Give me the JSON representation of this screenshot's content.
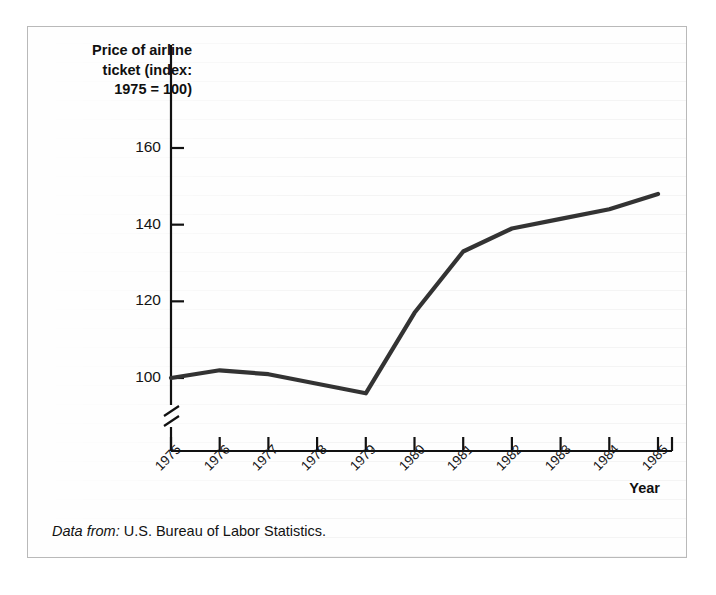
{
  "figure": {
    "y_axis_title": "Price of airline\nticket (index:\n1975 = 100)",
    "x_axis_title": "Year",
    "source_lead": "Data from:",
    "source_text": " U.S. Bureau of Labor Statistics.",
    "line_color": "#333333",
    "axis_color": "#111111",
    "frame_color": "#b9b9b9"
  },
  "chart_data": {
    "type": "line",
    "title": "",
    "xlabel": "Year",
    "ylabel": "Price of airline ticket (index: 1975 = 100)",
    "categories": [
      "1975",
      "1976",
      "1977",
      "1978",
      "1979",
      "1980",
      "1981",
      "1982",
      "1983",
      "1984",
      "1985"
    ],
    "x": [
      1975,
      1976,
      1977,
      1978,
      1979,
      1980,
      1981,
      1982,
      1983,
      1984,
      1985
    ],
    "values": [
      100,
      102,
      101,
      98.5,
      96,
      117,
      133,
      139,
      141.5,
      144,
      148
    ],
    "ylim": [
      90,
      168
    ],
    "yticks": [
      100,
      120,
      140,
      160
    ],
    "ytick_labels": [
      "100",
      "120",
      "140",
      "160"
    ],
    "grid": false,
    "legend": null,
    "axis_break": {
      "axis": "y",
      "note": "zigzag break on vertical axis below 100"
    },
    "series": [
      {
        "name": "Price of airline ticket (index: 1975 = 100)",
        "values": [
          100,
          102,
          101,
          98.5,
          96,
          117,
          133,
          139,
          141.5,
          144,
          148
        ]
      }
    ]
  }
}
